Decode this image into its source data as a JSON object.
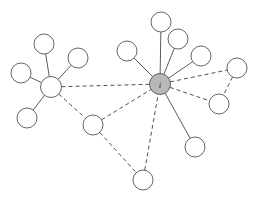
{
  "figure": {
    "type": "node-link-network-diagram",
    "width": 260,
    "height": 202,
    "background_color": "#ffffff",
    "hub_label": "i"
  },
  "style": {
    "node_fill": "#ffffff",
    "node_stroke": "#555555",
    "hub_fill": "#b8b8b8",
    "edge_solid_color": "#4a4a4a",
    "edge_dashed_color": "#3d3d3d",
    "node_radius": 10,
    "hub_radius": 10.5
  },
  "chart_data": {
    "type": "network",
    "title": "",
    "node_count": 17,
    "edge_count": 20,
    "nodes": [
      {
        "id": "hub-left",
        "x": 51,
        "y": 87,
        "r": 10.5,
        "role": "hub",
        "filled": false,
        "label": ""
      },
      {
        "id": "hub-right",
        "x": 160,
        "y": 84,
        "r": 10.5,
        "role": "hub",
        "filled": true,
        "label": "i"
      },
      {
        "id": "n1",
        "x": 44,
        "y": 44,
        "r": 10,
        "role": "leaf",
        "filled": false,
        "label": ""
      },
      {
        "id": "n2",
        "x": 78,
        "y": 58,
        "r": 10,
        "role": "leaf",
        "filled": false,
        "label": ""
      },
      {
        "id": "n3",
        "x": 21,
        "y": 73,
        "r": 10,
        "role": "leaf",
        "filled": false,
        "label": ""
      },
      {
        "id": "n4",
        "x": 27,
        "y": 118,
        "r": 10,
        "role": "leaf",
        "filled": false,
        "label": ""
      },
      {
        "id": "n5",
        "x": 93,
        "y": 125,
        "r": 10,
        "role": "bridge",
        "filled": false,
        "label": ""
      },
      {
        "id": "n6",
        "x": 143,
        "y": 180,
        "r": 10,
        "role": "leaf",
        "filled": false,
        "label": ""
      },
      {
        "id": "n7",
        "x": 127,
        "y": 51,
        "r": 10,
        "role": "leaf",
        "filled": false,
        "label": ""
      },
      {
        "id": "n8",
        "x": 161,
        "y": 22,
        "r": 10,
        "role": "leaf",
        "filled": false,
        "label": ""
      },
      {
        "id": "n9",
        "x": 178,
        "y": 39,
        "r": 10,
        "role": "leaf",
        "filled": false,
        "label": ""
      },
      {
        "id": "n10",
        "x": 201,
        "y": 56,
        "r": 10,
        "role": "leaf",
        "filled": false,
        "label": ""
      },
      {
        "id": "n11",
        "x": 237,
        "y": 68,
        "r": 10,
        "role": "leaf",
        "filled": false,
        "label": ""
      },
      {
        "id": "n12",
        "x": 219,
        "y": 104,
        "r": 10,
        "role": "leaf",
        "filled": false,
        "label": ""
      },
      {
        "id": "n13",
        "x": 195,
        "y": 147,
        "r": 10,
        "role": "leaf",
        "filled": false,
        "label": ""
      },
      {
        "id": "n14",
        "x": 63,
        "y": 99,
        "r": 0,
        "role": "hidden",
        "filled": false,
        "label": ""
      },
      {
        "id": "n15",
        "x": 150,
        "y": 62,
        "r": 0,
        "role": "hidden",
        "filled": false,
        "label": ""
      }
    ],
    "edges": [
      {
        "source": "hub-left",
        "target": "n1",
        "style": "solid"
      },
      {
        "source": "hub-left",
        "target": "n2",
        "style": "solid"
      },
      {
        "source": "hub-left",
        "target": "n3",
        "style": "solid"
      },
      {
        "source": "hub-left",
        "target": "n4",
        "style": "solid"
      },
      {
        "source": "hub-left",
        "target": "hub-right",
        "style": "dashed"
      },
      {
        "source": "hub-left",
        "target": "n5",
        "style": "dashed"
      },
      {
        "source": "n5",
        "target": "hub-right",
        "style": "dashed"
      },
      {
        "source": "n5",
        "target": "n6",
        "style": "dashed"
      },
      {
        "source": "n6",
        "target": "hub-right",
        "style": "dashed"
      },
      {
        "source": "hub-right",
        "target": "n7",
        "style": "solid"
      },
      {
        "source": "hub-right",
        "target": "n8",
        "style": "solid"
      },
      {
        "source": "hub-right",
        "target": "n9",
        "style": "solid"
      },
      {
        "source": "hub-right",
        "target": "n10",
        "style": "solid"
      },
      {
        "source": "hub-right",
        "target": "n13",
        "style": "solid"
      },
      {
        "source": "hub-right",
        "target": "n11",
        "style": "dashed"
      },
      {
        "source": "hub-right",
        "target": "n12",
        "style": "dashed"
      },
      {
        "source": "n11",
        "target": "n12",
        "style": "dashed"
      }
    ],
    "legend": [],
    "annotations": []
  }
}
